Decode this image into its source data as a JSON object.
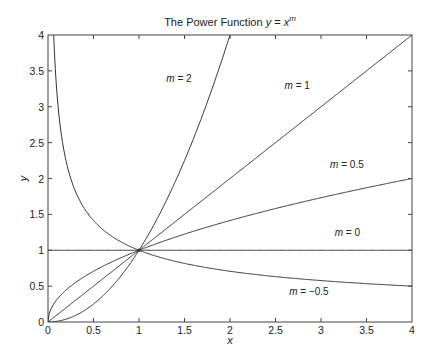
{
  "chart_data": {
    "type": "line",
    "title_parts": {
      "prefix": "The Power Function ",
      "y": "y",
      "eq": " = ",
      "x": "x",
      "exp": "m"
    },
    "xlabel": "x",
    "ylabel": "y",
    "xlim": [
      0,
      4
    ],
    "ylim": [
      0,
      4
    ],
    "xticks": [
      0,
      0.5,
      1,
      1.5,
      2,
      2.5,
      3,
      3.5,
      4
    ],
    "xtick_labels": [
      "0",
      "0.5",
      "1",
      "1.5",
      "2",
      "2.5",
      "3",
      "3.5",
      "4"
    ],
    "yticks": [
      0,
      0.5,
      1,
      1.5,
      2,
      2.5,
      3,
      3.5,
      4
    ],
    "ytick_labels": [
      "0",
      "0.5",
      "1",
      "1.5",
      "2",
      "2.5",
      "3",
      "3.5",
      "4"
    ],
    "grid": false,
    "legend": "none (inline curve labels)",
    "series": [
      {
        "name": "m = 2",
        "exponent": 2,
        "label_var": "m",
        "label_rest": " = 2",
        "label_pos": [
          1.3,
          3.35
        ]
      },
      {
        "name": "m = 1",
        "exponent": 1,
        "label_var": "m",
        "label_rest": " = 1",
        "label_pos": [
          2.6,
          3.25
        ]
      },
      {
        "name": "m = 0.5",
        "exponent": 0.5,
        "label_var": "m",
        "label_rest": " = 0.5",
        "label_pos": [
          3.1,
          2.15
        ]
      },
      {
        "name": "m = 0",
        "exponent": 0,
        "label_var": "m",
        "label_rest": " = 0",
        "label_pos": [
          3.15,
          1.2
        ]
      },
      {
        "name": "m = -0.5",
        "exponent": -0.5,
        "label_var": "m",
        "label_rest": " =  −0.5",
        "label_pos": [
          2.65,
          0.37
        ]
      }
    ],
    "annotations": [
      {
        "type": "point",
        "x": 1,
        "y": 1,
        "description": "common intersection marker"
      }
    ]
  },
  "colors": {
    "line": "#333333",
    "axes": "#444444",
    "text": "#222222",
    "background": "#ffffff"
  }
}
